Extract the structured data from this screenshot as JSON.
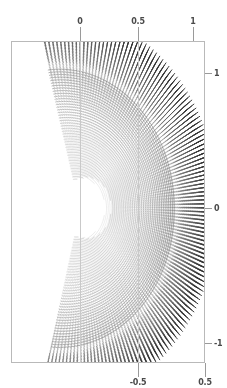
{
  "figure": {
    "width": 227,
    "height": 388,
    "background": "#ffffff",
    "title": "",
    "frame": {
      "left": 11,
      "top": 41,
      "right": 205,
      "bottom": 363,
      "color": "#b9b9b9"
    }
  },
  "chart_data": {
    "type": "scatter",
    "subtype": "vector-field-quiver",
    "title": "",
    "xlabel": "",
    "ylabel": "",
    "grid": true,
    "legend": null,
    "xlim": [
      -0.62,
      1.11
    ],
    "ylim": [
      -1.19,
      1.19
    ],
    "axes": {
      "top": {
        "ticks": [
          0,
          0.5,
          1
        ],
        "ticklabels": [
          "0",
          "0.5",
          "1"
        ],
        "pixel_positions": [
          80,
          138,
          193
        ]
      },
      "bottom": {
        "ticks": [
          -0.5,
          0.5
        ],
        "ticklabels": [
          "-0.5",
          "0.5"
        ],
        "pixel_positions": [
          138,
          205
        ]
      },
      "right": {
        "ticks": [
          1,
          0,
          -1
        ],
        "ticklabels": [
          "1",
          "0",
          "-1"
        ],
        "pixel_positions": [
          73,
          208,
          343
        ]
      },
      "left": {
        "ticks": [],
        "ticklabels": [],
        "pixel_positions": []
      }
    },
    "gridlines_vertical_px": [
      80,
      138
    ],
    "field": {
      "description": "Dipole-like vector field rendered as dense short dashes on concentric arcs forming a cardioid/crescent region with a radial fan on the right",
      "origin_px": [
        80,
        208
      ],
      "unit_px_per_x": 113.5,
      "unit_px_per_y": 135.0,
      "inner_void_radius": 0.22,
      "rings": 58,
      "samples_per_ring": 132,
      "angle_start_deg": -104,
      "angle_end_deg": 104,
      "r_min": 0.16,
      "r_max": 1.09,
      "dash_min_px": 1.1,
      "dash_max_px": 11.5,
      "color_near": "#b9b9b9",
      "color_far": "#2e2e2e",
      "cardioid_a": 0.46,
      "cardioid_shift": 0.03
    }
  }
}
